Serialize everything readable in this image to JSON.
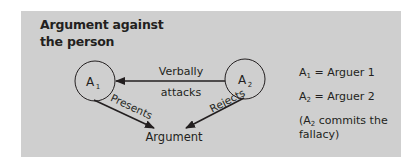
{
  "figure": {
    "title_line1": "Argument against",
    "title_line2": "the person",
    "colors": {
      "panel_background": "#cfcfcf",
      "text": "#231f20",
      "lines": "#231f20"
    },
    "nodes": {
      "a1": {
        "base": "A",
        "sub": "1"
      },
      "a2": {
        "base": "A",
        "sub": "2"
      },
      "argument": "Argument"
    },
    "edges": {
      "a2_to_a1_label_line1": "Verbally",
      "a2_to_a1_label_line2": "attacks",
      "a1_to_argument_label": "Presents",
      "a2_to_argument_label": "Rejects"
    },
    "legend": {
      "row1": {
        "base": "A",
        "sub": "1",
        "text": " = Arguer 1"
      },
      "row2": {
        "base": "A",
        "sub": "2",
        "text": " = Arguer 2"
      },
      "note": {
        "prefix": "(A",
        "sub": "2",
        "text": " commits the fallacy)"
      }
    }
  }
}
